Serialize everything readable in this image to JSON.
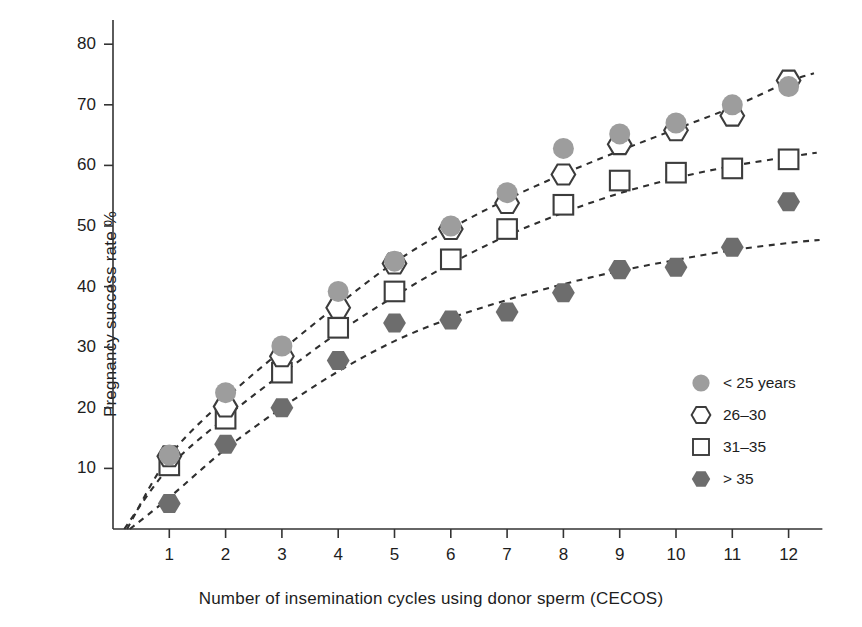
{
  "chart_data": {
    "type": "scatter",
    "title": "",
    "xlabel": "Number of insemination cycles using donor sperm (CECOS)",
    "ylabel": "Pregnancy success rate %",
    "x": [
      1,
      2,
      3,
      4,
      5,
      6,
      7,
      8,
      9,
      10,
      11,
      12
    ],
    "xtick_labels": [
      "1",
      "2",
      "3",
      "4",
      "5",
      "6",
      "7",
      "8",
      "9",
      "10",
      "11",
      "12"
    ],
    "ytick_labels": [
      "10",
      "20",
      "30",
      "40",
      "50",
      "60",
      "70",
      "80"
    ],
    "yticks": [
      10,
      20,
      30,
      40,
      50,
      60,
      70,
      80
    ],
    "xlim": [
      0,
      12.6
    ],
    "ylim": [
      0,
      84
    ],
    "grid": false,
    "legend_position": "right-middle",
    "trendline_style": "dashed",
    "series": [
      {
        "name": "< 25 years",
        "marker": "filled-circle",
        "color": "#9a9a9a",
        "values": [
          12.2,
          22.5,
          30.2,
          39.2,
          44.2,
          50.0,
          55.5,
          62.8,
          65.2,
          67.0,
          70.0,
          73.0
        ]
      },
      {
        "name": "26–30",
        "marker": "open-hexagon",
        "color": "#4a4a4a",
        "values": [
          12.0,
          20.2,
          28.5,
          36.5,
          43.8,
          49.5,
          53.8,
          58.5,
          63.5,
          65.8,
          68.2,
          74.0
        ]
      },
      {
        "name": "31–35",
        "marker": "open-square",
        "color": "#555555",
        "values": [
          10.5,
          18.2,
          25.8,
          33.2,
          39.2,
          44.5,
          49.5,
          53.5,
          57.5,
          58.8,
          59.5,
          61.0
        ]
      },
      {
        "name": "> 35",
        "marker": "filled-hexagon",
        "color": "#6d6d6d",
        "values": [
          4.2,
          14.0,
          20.0,
          27.8,
          34.0,
          34.5,
          35.8,
          39.0,
          42.8,
          43.2,
          46.5,
          54.0
        ]
      }
    ],
    "trendlines": [
      {
        "series": "< 25 years",
        "points": [
          [
            0.25,
            0.0
          ],
          [
            1,
            12.0
          ],
          [
            2,
            21.5
          ],
          [
            3,
            29.5
          ],
          [
            4,
            37.0
          ],
          [
            5,
            44.0
          ],
          [
            6,
            49.6
          ],
          [
            7,
            54.4
          ],
          [
            8,
            58.6
          ],
          [
            9,
            62.4
          ],
          [
            10,
            66.0
          ],
          [
            11,
            69.6
          ],
          [
            12,
            73.8
          ],
          [
            12.45,
            75.2
          ]
        ]
      },
      {
        "series": "31–35",
        "points": [
          [
            0.2,
            0.0
          ],
          [
            1,
            10.2
          ],
          [
            2,
            18.4
          ],
          [
            3,
            25.6
          ],
          [
            4,
            32.4
          ],
          [
            5,
            38.4
          ],
          [
            6,
            43.8
          ],
          [
            7,
            48.4
          ],
          [
            8,
            52.2
          ],
          [
            9,
            55.4
          ],
          [
            10,
            57.9
          ],
          [
            11,
            59.9
          ],
          [
            12,
            61.4
          ],
          [
            12.5,
            62.1
          ]
        ]
      },
      {
        "series": "> 35",
        "points": [
          [
            0.3,
            0.0
          ],
          [
            1,
            5.2
          ],
          [
            2,
            13.2
          ],
          [
            3,
            20.0
          ],
          [
            4,
            26.0
          ],
          [
            5,
            31.0
          ],
          [
            6,
            34.8
          ],
          [
            7,
            37.8
          ],
          [
            8,
            40.4
          ],
          [
            9,
            42.6
          ],
          [
            10,
            44.4
          ],
          [
            11,
            46.0
          ],
          [
            12,
            47.2
          ],
          [
            12.55,
            47.7
          ]
        ]
      }
    ],
    "legend": [
      {
        "label": "< 25 years",
        "marker": "filled-circle"
      },
      {
        "label": "26–30",
        "marker": "open-hexagon"
      },
      {
        "label": "31–35",
        "marker": "open-square"
      },
      {
        "label": "> 35",
        "marker": "filled-hexagon"
      }
    ],
    "colors": {
      "light_gray_fill": "#9d9d9d",
      "dark_gray_fill": "#6d6d6d",
      "outline": "#3c3c3c",
      "axis": "#333333",
      "text": "#1d1d1d"
    }
  }
}
